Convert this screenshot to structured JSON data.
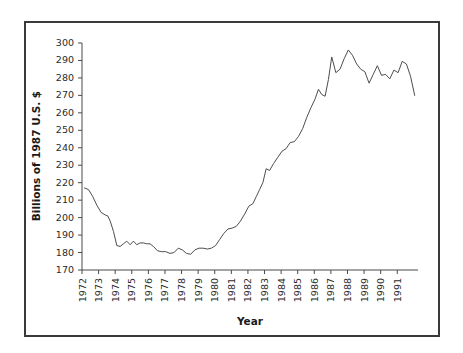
{
  "figure": {
    "background_color": "#ffffff",
    "border_color": "#3a3a3a",
    "line_color": "#4d4d4d"
  },
  "chart_data": {
    "type": "line",
    "title": "",
    "xlabel": "Year",
    "ylabel": "Billions of 1987 U.S. $",
    "xlim": [
      1972.0,
      1992.25
    ],
    "ylim": [
      170,
      300
    ],
    "grid": false,
    "legend": null,
    "ytick_labels": [
      "170",
      "180",
      "190",
      "200",
      "210",
      "220",
      "230",
      "240",
      "250",
      "260",
      "270",
      "280",
      "290",
      "300"
    ],
    "yticks": [
      170,
      180,
      190,
      200,
      210,
      220,
      230,
      240,
      250,
      260,
      270,
      280,
      290,
      300
    ],
    "xtick_labels": [
      "1972",
      "1973",
      "1974",
      "1975",
      "1976",
      "1977",
      "1978",
      "1979",
      "1980",
      "1981",
      "1982",
      "1983",
      "1984",
      "1985",
      "1986",
      "1987",
      "1988",
      "1989",
      "1990",
      "1991"
    ],
    "xticks": [
      1972,
      1973,
      1974,
      1975,
      1976,
      1977,
      1978,
      1979,
      1980,
      1981,
      1982,
      1983,
      1984,
      1985,
      1986,
      1987,
      1988,
      1989,
      1990,
      1991
    ],
    "series": [
      {
        "name": "Real expenditure",
        "x": [
          1972.15,
          1972.4,
          1972.65,
          1972.9,
          1973.15,
          1973.4,
          1973.55,
          1973.7,
          1973.9,
          1974.1,
          1974.3,
          1974.5,
          1974.7,
          1974.9,
          1975.1,
          1975.3,
          1975.5,
          1975.7,
          1975.9,
          1976.1,
          1976.3,
          1976.55,
          1976.8,
          1977.05,
          1977.3,
          1977.55,
          1977.8,
          1978.05,
          1978.3,
          1978.55,
          1978.8,
          1979.05,
          1979.3,
          1979.55,
          1979.8,
          1980.05,
          1980.3,
          1980.55,
          1980.8,
          1981.05,
          1981.3,
          1981.55,
          1981.8,
          1982.05,
          1982.3,
          1982.5,
          1982.7,
          1982.9,
          1983.1,
          1983.3,
          1983.55,
          1983.8,
          1984.05,
          1984.3,
          1984.55,
          1984.8,
          1985.05,
          1985.3,
          1985.55,
          1985.8,
          1986.05,
          1986.25,
          1986.45,
          1986.65,
          1986.85,
          1987.05,
          1987.3,
          1987.55,
          1987.8,
          1988.05,
          1988.3,
          1988.55,
          1988.8,
          1989.05,
          1989.3,
          1989.55,
          1989.8,
          1990.05,
          1990.3,
          1990.55,
          1990.8,
          1991.05,
          1991.3,
          1991.55,
          1991.8,
          1992.05
        ],
        "y": [
          217.0,
          216.0,
          212.0,
          207.0,
          203.0,
          201.5,
          201.0,
          198.0,
          192.0,
          184.0,
          183.5,
          185.0,
          186.5,
          184.5,
          186.5,
          184.5,
          185.5,
          185.5,
          185.0,
          185.0,
          183.5,
          181.0,
          180.5,
          180.5,
          179.5,
          180.0,
          182.5,
          181.5,
          179.5,
          179.0,
          181.5,
          182.5,
          182.5,
          182.0,
          182.5,
          184.0,
          187.5,
          191.0,
          193.5,
          194.0,
          195.0,
          198.0,
          202.0,
          206.5,
          208.0,
          212.0,
          216.0,
          220.0,
          228.0,
          227.0,
          231.0,
          234.5,
          238.0,
          239.5,
          243.0,
          243.5,
          246.5,
          251.0,
          257.5,
          263.0,
          268.0,
          273.5,
          270.5,
          269.5,
          279.0,
          292.0,
          283.0,
          285.0,
          291.0,
          296.0,
          293.0,
          288.0,
          285.0,
          283.5,
          277.0,
          282.0,
          287.0,
          281.5,
          282.0,
          279.5,
          284.5,
          283.0,
          289.5,
          288.0,
          281.0,
          270.0
        ]
      }
    ]
  }
}
